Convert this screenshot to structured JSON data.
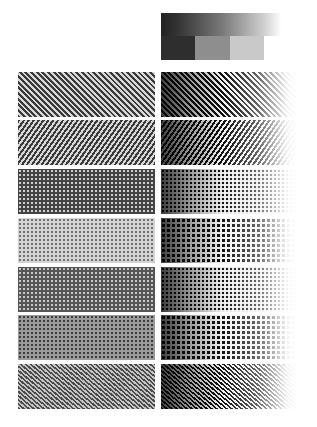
{
  "reference_strip": {
    "gradient": {
      "from": "#222222",
      "to": "#ffffff"
    },
    "steps": [
      {
        "label": "step-1",
        "color": "#2e2e2e"
      },
      {
        "label": "step-2",
        "color": "#8e8e8e"
      },
      {
        "label": "step-3",
        "color": "#c9c9c9"
      },
      {
        "label": "step-4",
        "color": "#ffffff"
      }
    ]
  },
  "rows": [
    {
      "index": 1,
      "left_pattern": "diagonal-lines-45",
      "right_pattern": "diagonal-lines-45-fade"
    },
    {
      "index": 2,
      "left_pattern": "diagonal-lines-135",
      "right_pattern": "diagonal-lines-135-fade"
    },
    {
      "index": 3,
      "left_pattern": "dot-screen-dark",
      "right_pattern": "dot-screen-fade"
    },
    {
      "index": 4,
      "left_pattern": "dot-screen-light",
      "right_pattern": "dot-screen-coarse-fade"
    },
    {
      "index": 5,
      "left_pattern": "dot-screen-mid",
      "right_pattern": "dot-screen-fade"
    },
    {
      "index": 6,
      "left_pattern": "dot-screen-mid-gray",
      "right_pattern": "dot-screen-fade"
    },
    {
      "index": 7,
      "left_pattern": "diagonal-fine",
      "right_pattern": "diagonal-fine-fade"
    }
  ]
}
